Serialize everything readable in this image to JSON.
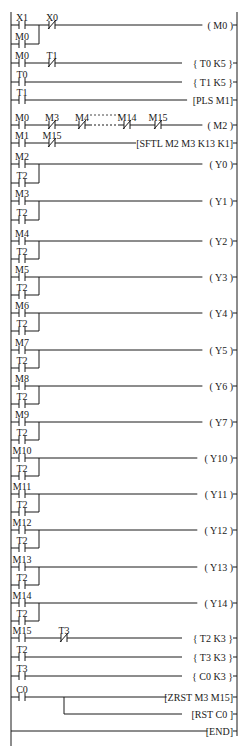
{
  "rails": {
    "left_x": 11,
    "right_x": 237,
    "top": 12,
    "bottom": 746
  },
  "rungs": [
    {
      "y": 25,
      "contacts": [
        {
          "label": "X1",
          "x": 22,
          "type": "NO"
        },
        {
          "label": "X0",
          "x": 52,
          "type": "NC"
        }
      ],
      "parallel": [
        {
          "label": "M0",
          "x": 22,
          "y": 44,
          "join_x": 39
        }
      ],
      "output": "( M0 )",
      "output_type": "coil"
    },
    {
      "y": 63,
      "contacts": [
        {
          "label": "M0",
          "x": 22,
          "type": "NO"
        },
        {
          "label": "T1",
          "x": 52,
          "type": "NC"
        }
      ],
      "output": "{ T0  K5 }",
      "output_type": "coil"
    },
    {
      "y": 82,
      "contacts": [
        {
          "label": "T0",
          "x": 22,
          "type": "NO"
        }
      ],
      "output": "{ T1  K5 }",
      "output_type": "coil"
    },
    {
      "y": 100,
      "contacts": [
        {
          "label": "T1",
          "x": 22,
          "type": "NO"
        }
      ],
      "output": "[PLS  M1]",
      "output_type": "instr"
    },
    {
      "y": 125,
      "contacts": [
        {
          "label": "M0",
          "x": 22,
          "type": "NO"
        },
        {
          "label": "M3",
          "x": 52,
          "type": "NC"
        },
        {
          "label": "M4",
          "x": 82,
          "type": "NC"
        },
        {
          "label": "M14",
          "x": 127,
          "type": "NC"
        },
        {
          "label": "M15",
          "x": 158,
          "type": "NC"
        }
      ],
      "dashed": {
        "x1": 90,
        "x2": 120,
        "label": "-----"
      },
      "output": "( M2 )",
      "output_type": "coil"
    },
    {
      "y": 143,
      "contacts": [
        {
          "label": "M1",
          "x": 22,
          "type": "NO"
        },
        {
          "label": "M15",
          "x": 52,
          "type": "NC"
        }
      ],
      "output": "[SFTL M2 M3 K13 K1]",
      "output_type": "instr"
    },
    {
      "y": 164,
      "contacts": [
        {
          "label": "M2",
          "x": 22,
          "type": "NO"
        }
      ],
      "parallel": [
        {
          "label": "T2",
          "x": 22,
          "y": 183,
          "join_x": 39
        }
      ],
      "output": "( Y0 )",
      "output_type": "coil"
    },
    {
      "y": 201,
      "contacts": [
        {
          "label": "M3",
          "x": 22,
          "type": "NO"
        }
      ],
      "parallel": [
        {
          "label": "T2",
          "x": 22,
          "y": 220,
          "join_x": 39
        }
      ],
      "output": "( Y1 )",
      "output_type": "coil"
    },
    {
      "y": 241,
      "contacts": [
        {
          "label": "M4",
          "x": 22,
          "type": "NO"
        }
      ],
      "parallel": [
        {
          "label": "T2",
          "x": 22,
          "y": 259,
          "join_x": 39
        }
      ],
      "output": "( Y2 )",
      "output_type": "coil"
    },
    {
      "y": 277,
      "contacts": [
        {
          "label": "M5",
          "x": 22,
          "type": "NO"
        }
      ],
      "parallel": [
        {
          "label": "T2",
          "x": 22,
          "y": 295,
          "join_x": 39
        }
      ],
      "output": "( Y3 )",
      "output_type": "coil"
    },
    {
      "y": 313,
      "contacts": [
        {
          "label": "M6",
          "x": 22,
          "type": "NO"
        }
      ],
      "parallel": [
        {
          "label": "T2",
          "x": 22,
          "y": 331,
          "join_x": 39
        }
      ],
      "output": "( Y4 )",
      "output_type": "coil"
    },
    {
      "y": 350,
      "contacts": [
        {
          "label": "M7",
          "x": 22,
          "type": "NO"
        }
      ],
      "parallel": [
        {
          "label": "T2",
          "x": 22,
          "y": 368,
          "join_x": 39
        }
      ],
      "output": "( Y5 )",
      "output_type": "coil"
    },
    {
      "y": 386,
      "contacts": [
        {
          "label": "M8",
          "x": 22,
          "type": "NO"
        }
      ],
      "parallel": [
        {
          "label": "T2",
          "x": 22,
          "y": 404,
          "join_x": 39
        }
      ],
      "output": "( Y6 )",
      "output_type": "coil"
    },
    {
      "y": 422,
      "contacts": [
        {
          "label": "M9",
          "x": 22,
          "type": "NO"
        }
      ],
      "parallel": [
        {
          "label": "T2",
          "x": 22,
          "y": 440,
          "join_x": 39
        }
      ],
      "output": "( Y7 )",
      "output_type": "coil"
    },
    {
      "y": 458,
      "contacts": [
        {
          "label": "M10",
          "x": 22,
          "type": "NO"
        }
      ],
      "parallel": [
        {
          "label": "T2",
          "x": 22,
          "y": 476,
          "join_x": 39
        }
      ],
      "output": "( Y10 )",
      "output_type": "coil"
    },
    {
      "y": 494,
      "contacts": [
        {
          "label": "M11",
          "x": 22,
          "type": "NO"
        }
      ],
      "parallel": [
        {
          "label": "T2",
          "x": 22,
          "y": 512,
          "join_x": 39
        }
      ],
      "output": "( Y11 )",
      "output_type": "coil"
    },
    {
      "y": 530,
      "contacts": [
        {
          "label": "M12",
          "x": 22,
          "type": "NO"
        }
      ],
      "parallel": [
        {
          "label": "T2",
          "x": 22,
          "y": 548,
          "join_x": 39
        }
      ],
      "output": "( Y12 )",
      "output_type": "coil"
    },
    {
      "y": 567,
      "contacts": [
        {
          "label": "M13",
          "x": 22,
          "type": "NO"
        }
      ],
      "parallel": [
        {
          "label": "T2",
          "x": 22,
          "y": 585,
          "join_x": 39
        }
      ],
      "output": "( Y13 )",
      "output_type": "coil"
    },
    {
      "y": 603,
      "contacts": [
        {
          "label": "M14",
          "x": 22,
          "type": "NO"
        }
      ],
      "parallel": [
        {
          "label": "T2",
          "x": 22,
          "y": 621,
          "join_x": 39
        }
      ],
      "output": "( Y14 )",
      "output_type": "coil"
    },
    {
      "y": 638,
      "contacts": [
        {
          "label": "M15",
          "x": 22,
          "type": "NO"
        },
        {
          "label": "T3",
          "x": 64,
          "type": "NC"
        }
      ],
      "output": "{ T2  K3 }",
      "output_type": "coil"
    },
    {
      "y": 657,
      "contacts": [
        {
          "label": "T2",
          "x": 22,
          "type": "NO"
        }
      ],
      "output": "{ T3  K3 }",
      "output_type": "coil"
    },
    {
      "y": 676,
      "contacts": [
        {
          "label": "T3",
          "x": 22,
          "type": "NO"
        }
      ],
      "output": "{ C0  K3 }",
      "output_type": "coil"
    },
    {
      "y": 697,
      "contacts": [
        {
          "label": "C0",
          "x": 22,
          "type": "NO"
        }
      ],
      "branch_out": {
        "x": 64,
        "y": 714,
        "output": "[RST  C0 ]"
      },
      "output": "[ZRST M3 M15]",
      "output_type": "instr"
    },
    {
      "y": 731,
      "contacts": [],
      "output": "[END]",
      "output_type": "instr"
    }
  ],
  "colors": {
    "ink": "#1a1a1a",
    "background": "#ffffff"
  }
}
